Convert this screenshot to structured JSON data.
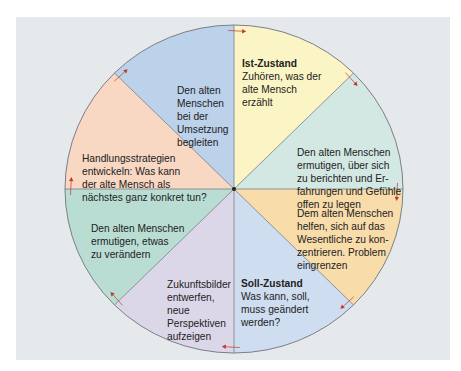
{
  "diagram": {
    "type": "circular-process",
    "center": [
      234,
      189
    ],
    "radius": [
      169,
      164
    ],
    "colors": {
      "background_panel": "#e6e9ec",
      "outline": "#7a7f88",
      "arrow": "#c0392b"
    },
    "sectors": [
      {
        "id": "ist-zustand",
        "color": "#fbf4c4",
        "title": "Ist-Zustand",
        "text": "Zuhören, was der\nalte Mensch\nerzählt"
      },
      {
        "id": "ermutigen-berichten",
        "color": "#d3e7e3",
        "title": "",
        "text": "Den alten Menschen\nermutigen, über sich\nzu berichten und Er-\nfahrungen und Gefühle\noffen zu legen"
      },
      {
        "id": "wesentliches",
        "color": "#f8dcaa",
        "title": "",
        "text": "Dem alten Menschen\nhelfen, sich auf das\nWesentliche zu kon-\nzentrieren. Problem\neingrenzen"
      },
      {
        "id": "soll-zustand",
        "color": "#cfddf0",
        "title": "Soll-Zustand",
        "text": "Was kann, soll,\nmuss geändert\nwerden?"
      },
      {
        "id": "zukunftsbilder",
        "color": "#dcd7e8",
        "title": "",
        "text": "Zukunftsbilder\nentwerfen,\nneue\nPerspektiven\naufzeigen"
      },
      {
        "id": "ermutigen-veraendern",
        "color": "#b9ddd2",
        "title": "",
        "text": "Den alten Menschen\nermutigen, etwas\nzu verändern"
      },
      {
        "id": "handlungsstrategien",
        "color": "#f8d8c3",
        "title": "",
        "text": "Handlungsstrategien\nentwickeln: Was kann\nder alte Mensch als\nnächstes ganz konkret tun?"
      },
      {
        "id": "umsetzung",
        "color": "#bcd1ea",
        "title": "",
        "text": "Den alten\nMenschen\nbei der\nUmsetzung\nbegleiten"
      }
    ]
  }
}
